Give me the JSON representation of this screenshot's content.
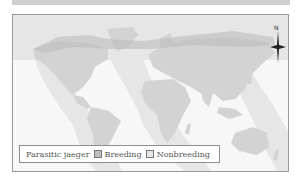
{
  "map": {
    "title": "Parasitic jaeger",
    "compass_label": "N",
    "colors": {
      "ocean": "#f7f7f7",
      "land": "#d6d6d6",
      "breeding": "#bdbdbd",
      "nonbreeding": "#e6e6e6",
      "frame_border": "#9a9a9a",
      "top_band": "#cfcfcf"
    }
  },
  "legend": {
    "species": "Parasitic jaeger",
    "items": [
      {
        "label": "Breeding",
        "color": "#bdbdbd"
      },
      {
        "label": "Nonbreeding",
        "color": "#e6e6e6"
      }
    ]
  }
}
